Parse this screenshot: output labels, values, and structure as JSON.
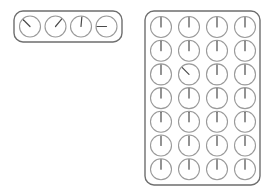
{
  "canvas": {
    "width": 275,
    "height": 196,
    "background": "#ffffff"
  },
  "style": {
    "panel_stroke": "#6e6e6e",
    "panel_stroke_width": 1.4,
    "panel_corner_radius": 9,
    "dial_circle_stroke": "#9a9a9a",
    "dial_circle_stroke_width": 1.1,
    "dial_hand_stroke": "#4a4a4a",
    "dial_hand_stroke_width": 1.2
  },
  "panels": [
    {
      "id": "top-left-panel",
      "name": "dial-row-panel",
      "label": "Dial row panel",
      "x": 14,
      "y": 11,
      "width": 108,
      "height": 31,
      "layout": {
        "columns": 4,
        "rows": 1,
        "dial_radius": 10.5,
        "first_center_x": 30,
        "first_center_y": 26.5,
        "step_x": 25.5,
        "step_y": 0
      },
      "dials": [
        {
          "name": "dial-1",
          "row": 1,
          "col": 1,
          "hand_angle_deg": 315,
          "hand_length": 9.5,
          "label": "dial 1"
        },
        {
          "name": "dial-2",
          "row": 1,
          "col": 2,
          "hand_angle_deg": 40,
          "hand_length": 9.5,
          "label": "dial 2"
        },
        {
          "name": "dial-3",
          "row": 1,
          "col": 3,
          "hand_angle_deg": 5,
          "hand_length": 9.5,
          "label": "dial 3"
        },
        {
          "name": "dial-4",
          "row": 1,
          "col": 4,
          "hand_angle_deg": 270,
          "hand_length": 9.5,
          "label": "dial 4"
        }
      ]
    },
    {
      "id": "right-grid-panel",
      "name": "dial-grid-panel",
      "label": "Dial grid panel",
      "x": 145,
      "y": 11,
      "width": 115,
      "height": 174,
      "layout": {
        "columns": 4,
        "rows": 7,
        "dial_radius": 10.5,
        "first_center_x": 161,
        "first_center_y": 27,
        "step_x": 28,
        "step_y": 23.7
      },
      "dials": [
        {
          "name": "grid-dial-r1c1",
          "row": 1,
          "col": 1,
          "hand_angle_deg": 0,
          "hand_length": 9.5,
          "label": "grid dial r1c1"
        },
        {
          "name": "grid-dial-r1c2",
          "row": 1,
          "col": 2,
          "hand_angle_deg": 0,
          "hand_length": 9.5,
          "label": "grid dial r1c2"
        },
        {
          "name": "grid-dial-r1c3",
          "row": 1,
          "col": 3,
          "hand_angle_deg": 0,
          "hand_length": 9.5,
          "label": "grid dial r1c3"
        },
        {
          "name": "grid-dial-r1c4",
          "row": 1,
          "col": 4,
          "hand_angle_deg": 0,
          "hand_length": 9.5,
          "label": "grid dial r1c4"
        },
        {
          "name": "grid-dial-r2c1",
          "row": 2,
          "col": 1,
          "hand_angle_deg": 0,
          "hand_length": 9.5,
          "label": "grid dial r2c1"
        },
        {
          "name": "grid-dial-r2c2",
          "row": 2,
          "col": 2,
          "hand_angle_deg": 0,
          "hand_length": 9.5,
          "label": "grid dial r2c2"
        },
        {
          "name": "grid-dial-r2c3",
          "row": 2,
          "col": 3,
          "hand_angle_deg": 0,
          "hand_length": 9.5,
          "label": "grid dial r2c3"
        },
        {
          "name": "grid-dial-r2c4",
          "row": 2,
          "col": 4,
          "hand_angle_deg": 0,
          "hand_length": 9.5,
          "label": "grid dial r2c4"
        },
        {
          "name": "grid-dial-r3c1",
          "row": 3,
          "col": 1,
          "hand_angle_deg": 0,
          "hand_length": 9.5,
          "label": "grid dial r3c1"
        },
        {
          "name": "grid-dial-r3c2",
          "row": 3,
          "col": 2,
          "hand_angle_deg": 315,
          "hand_length": 9.5,
          "label": "grid dial r3c2"
        },
        {
          "name": "grid-dial-r3c3",
          "row": 3,
          "col": 3,
          "hand_angle_deg": 0,
          "hand_length": 9.5,
          "label": "grid dial r3c3"
        },
        {
          "name": "grid-dial-r3c4",
          "row": 3,
          "col": 4,
          "hand_angle_deg": 0,
          "hand_length": 9.5,
          "label": "grid dial r3c4"
        },
        {
          "name": "grid-dial-r4c1",
          "row": 4,
          "col": 1,
          "hand_angle_deg": 0,
          "hand_length": 9.5,
          "label": "grid dial r4c1"
        },
        {
          "name": "grid-dial-r4c2",
          "row": 4,
          "col": 2,
          "hand_angle_deg": 0,
          "hand_length": 9.5,
          "label": "grid dial r4c2"
        },
        {
          "name": "grid-dial-r4c3",
          "row": 4,
          "col": 3,
          "hand_angle_deg": 0,
          "hand_length": 9.5,
          "label": "grid dial r4c3"
        },
        {
          "name": "grid-dial-r4c4",
          "row": 4,
          "col": 4,
          "hand_angle_deg": 0,
          "hand_length": 9.5,
          "label": "grid dial r4c4"
        },
        {
          "name": "grid-dial-r5c1",
          "row": 5,
          "col": 1,
          "hand_angle_deg": 0,
          "hand_length": 9.5,
          "label": "grid dial r5c1"
        },
        {
          "name": "grid-dial-r5c2",
          "row": 5,
          "col": 2,
          "hand_angle_deg": 0,
          "hand_length": 9.5,
          "label": "grid dial r5c2"
        },
        {
          "name": "grid-dial-r5c3",
          "row": 5,
          "col": 3,
          "hand_angle_deg": 0,
          "hand_length": 9.5,
          "label": "grid dial r5c3"
        },
        {
          "name": "grid-dial-r5c4",
          "row": 5,
          "col": 4,
          "hand_angle_deg": 0,
          "hand_length": 9.5,
          "label": "grid dial r5c4"
        },
        {
          "name": "grid-dial-r6c1",
          "row": 6,
          "col": 1,
          "hand_angle_deg": 0,
          "hand_length": 9.5,
          "label": "grid dial r6c1"
        },
        {
          "name": "grid-dial-r6c2",
          "row": 6,
          "col": 2,
          "hand_angle_deg": 0,
          "hand_length": 9.5,
          "label": "grid dial r6c2"
        },
        {
          "name": "grid-dial-r6c3",
          "row": 6,
          "col": 3,
          "hand_angle_deg": 0,
          "hand_length": 9.5,
          "label": "grid dial r6c3"
        },
        {
          "name": "grid-dial-r6c4",
          "row": 6,
          "col": 4,
          "hand_angle_deg": 0,
          "hand_length": 9.5,
          "label": "grid dial r6c4"
        },
        {
          "name": "grid-dial-r7c1",
          "row": 7,
          "col": 1,
          "hand_angle_deg": 0,
          "hand_length": 9.5,
          "label": "grid dial r7c1"
        },
        {
          "name": "grid-dial-r7c2",
          "row": 7,
          "col": 2,
          "hand_angle_deg": 0,
          "hand_length": 9.5,
          "label": "grid dial r7c2"
        },
        {
          "name": "grid-dial-r7c3",
          "row": 7,
          "col": 3,
          "hand_angle_deg": 0,
          "hand_length": 9.5,
          "label": "grid dial r7c3"
        },
        {
          "name": "grid-dial-r7c4",
          "row": 7,
          "col": 4,
          "hand_angle_deg": 0,
          "hand_length": 9.5,
          "label": "grid dial r7c4"
        }
      ]
    }
  ]
}
